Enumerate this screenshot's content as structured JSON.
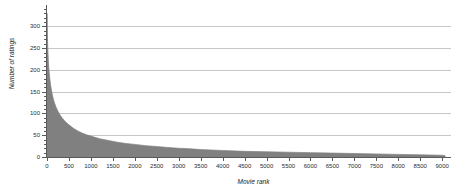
{
  "chart_data": {
    "type": "area",
    "title": "",
    "xlabel": "Movie rank",
    "ylabel": "Number of ratings",
    "xlim": [
      0,
      9200
    ],
    "ylim": [
      0,
      340
    ],
    "grid": true,
    "legend": false,
    "series_color": "#808080",
    "grid_color": "#c8c8c8",
    "axis_color": "#5a5a5a",
    "x_ticks": [
      0,
      500,
      1000,
      1500,
      2000,
      2500,
      3000,
      3500,
      4000,
      4500,
      5000,
      5500,
      6000,
      6500,
      7000,
      7500,
      8000,
      8500,
      9000
    ],
    "y_ticks": [
      0,
      50,
      100,
      150,
      200,
      250,
      300
    ],
    "y_minor_ticks": [
      10,
      20,
      30,
      40,
      60,
      70,
      80,
      90,
      110,
      120,
      130,
      140,
      160,
      170,
      180,
      190,
      210,
      220,
      230,
      240,
      260,
      270,
      280,
      290,
      310,
      320,
      330,
      340
    ],
    "x": [
      1,
      5,
      10,
      15,
      20,
      30,
      40,
      50,
      65,
      80,
      100,
      125,
      150,
      175,
      200,
      250,
      300,
      350,
      400,
      450,
      500,
      600,
      700,
      800,
      900,
      1000,
      1200,
      1400,
      1600,
      1800,
      2000,
      2250,
      2500,
      2750,
      3000,
      3250,
      3500,
      3750,
      4000,
      4500,
      5000,
      5500,
      6000,
      6500,
      7000,
      7500,
      8000,
      8500,
      9000,
      9066
    ],
    "values": [
      330,
      300,
      275,
      258,
      244,
      222,
      206,
      194,
      179,
      167,
      154,
      141,
      131,
      123,
      116,
      105,
      96,
      89,
      83,
      78,
      74,
      66,
      60,
      55,
      51,
      48,
      42,
      38,
      34,
      31,
      29,
      26,
      24,
      22,
      20,
      19,
      17,
      16,
      15,
      13,
      12,
      11,
      10,
      9,
      8,
      7,
      6,
      5,
      4,
      3
    ]
  }
}
